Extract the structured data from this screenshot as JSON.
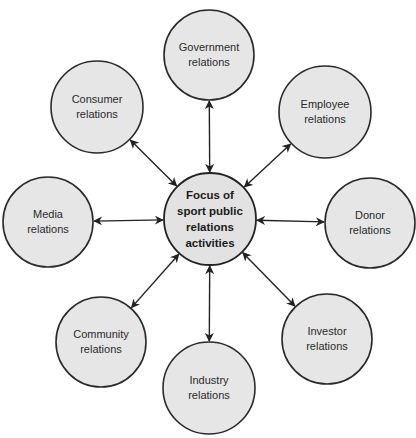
{
  "diagram": {
    "type": "hub-and-spoke",
    "center": {
      "id": "focus",
      "lines": [
        "Focus of",
        "sport public",
        "relations",
        "activities"
      ],
      "cx": 210,
      "cy": 219,
      "r": 46
    },
    "nodes": [
      {
        "id": "government",
        "lines": [
          "Government",
          "relations"
        ],
        "cx": 209,
        "cy": 55,
        "r": 45
      },
      {
        "id": "employee",
        "lines": [
          "Employee",
          "relations"
        ],
        "cx": 325,
        "cy": 112,
        "r": 46
      },
      {
        "id": "donor",
        "lines": [
          "Donor",
          "relations"
        ],
        "cx": 370,
        "cy": 223,
        "r": 45
      },
      {
        "id": "investor",
        "lines": [
          "Investor",
          "relations"
        ],
        "cx": 327,
        "cy": 339,
        "r": 45
      },
      {
        "id": "industry",
        "lines": [
          "Industry",
          "relations"
        ],
        "cx": 209,
        "cy": 388,
        "r": 46
      },
      {
        "id": "community",
        "lines": [
          "Community",
          "relations"
        ],
        "cx": 101,
        "cy": 342,
        "r": 45
      },
      {
        "id": "media",
        "lines": [
          "Media",
          "relations"
        ],
        "cx": 48,
        "cy": 222,
        "r": 45
      },
      {
        "id": "consumer",
        "lines": [
          "Consumer",
          "relations"
        ],
        "cx": 97,
        "cy": 107,
        "r": 46
      }
    ],
    "edges": [
      {
        "from": "focus",
        "to": "government",
        "arrows": "both"
      },
      {
        "from": "focus",
        "to": "employee",
        "arrows": "both"
      },
      {
        "from": "focus",
        "to": "donor",
        "arrows": "both"
      },
      {
        "from": "focus",
        "to": "investor",
        "arrows": "both"
      },
      {
        "from": "focus",
        "to": "industry",
        "arrows": "both"
      },
      {
        "from": "focus",
        "to": "community",
        "arrows": "both"
      },
      {
        "from": "focus",
        "to": "media",
        "arrows": "both"
      },
      {
        "from": "focus",
        "to": "consumer",
        "arrows": "both"
      }
    ],
    "colors": {
      "circle_fill": "#e6e6e6",
      "stroke": "#222222",
      "text": "#2a2a2a",
      "background": "#ffffff"
    }
  }
}
